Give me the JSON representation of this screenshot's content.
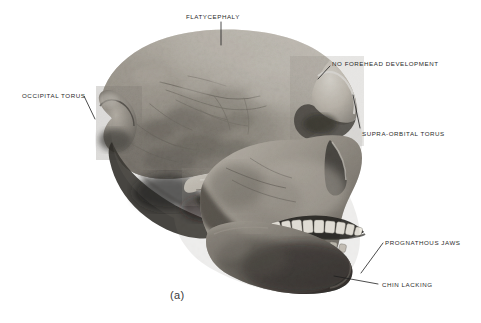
{
  "figure": {
    "caption": "(a)",
    "background_color": "#ffffff",
    "label_color": "#2a2a2a",
    "leader_line_color": "#1e1e1e"
  },
  "annotations": [
    {
      "id": "flatycephaly",
      "label": "FLATYCEPHALY",
      "label_x": 186,
      "label_y": 14,
      "anchor": "start",
      "leader": [
        [
          221,
          22
        ],
        [
          221,
          45
        ]
      ]
    },
    {
      "id": "no-forehead-development",
      "label": "NO FOREHEAD DEVELOPMENT",
      "label_x": 332,
      "label_y": 61,
      "anchor": "start",
      "leader": [
        [
          330,
          66
        ],
        [
          318,
          79
        ]
      ]
    },
    {
      "id": "occipital-torus",
      "label": "OCCIPITAL TORUS",
      "label_x": 22,
      "label_y": 93,
      "anchor": "start",
      "leader": [
        [
          84,
          96
        ],
        [
          94,
          118
        ]
      ]
    },
    {
      "id": "supra-orbital-torus",
      "label": "SUPRA-ORBITAL TORUS",
      "label_x": 362,
      "label_y": 131,
      "anchor": "start",
      "leader": [
        [
          360,
          128
        ],
        [
          354,
          96
        ]
      ]
    },
    {
      "id": "prognathous-jaws",
      "label": "PROGNATHOUS JAWS",
      "label_x": 385,
      "label_y": 240,
      "anchor": "start",
      "leader": [
        [
          383,
          243
        ],
        [
          362,
          272
        ]
      ]
    },
    {
      "id": "chin-lacking",
      "label": "CHIN LACKING",
      "label_x": 382,
      "label_y": 282,
      "anchor": "start",
      "leader": [
        [
          378,
          284
        ],
        [
          336,
          277
        ]
      ]
    }
  ],
  "colors": {
    "bone_highlight": "#f2efe9",
    "bone_light": "#d8d3c9",
    "bone_mid": "#a9a399",
    "bone_shadow": "#6d6962",
    "bone_deep_shadow": "#3a3832",
    "cavity_black": "#141312",
    "tooth_enamel": "#efece3"
  }
}
